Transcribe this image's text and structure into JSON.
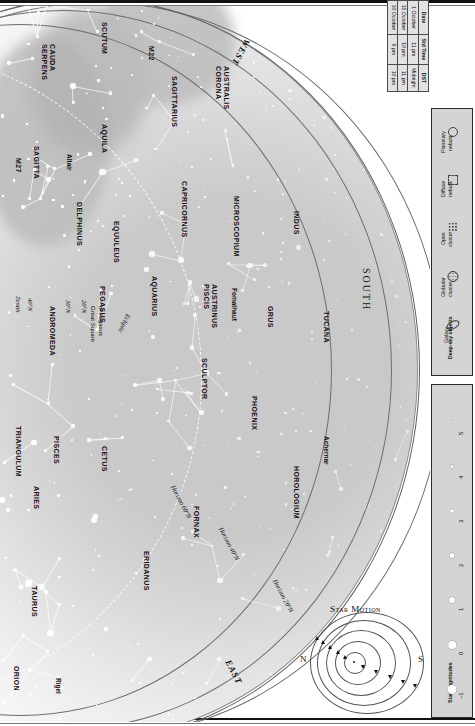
{
  "chart_data": {
    "type": "scatter",
    "subtitle": "All-sky map looking south, printed sideways",
    "axis_note": "Sky dome projection; concentric arcs are horizon lines for 20°N, 40°N and 60°N latitude",
    "grid": false,
    "legend_position": "right-rail",
    "compass": [
      "WEST",
      "SOUTH",
      "EAST"
    ],
    "zenith_label": "Zenith",
    "horizons": [
      "Horizon 20°N",
      "Horizon 40°N",
      "Horizon 60°N"
    ],
    "latitude_marks": [
      "40°N",
      "30°N",
      "20°N"
    ],
    "ecliptic_label": "Ecliptic",
    "asterisms": [
      "Great Square of Pegasus"
    ],
    "constellations": [
      "SERPENS CAUDA",
      "SCUTUM",
      "AQUILA",
      "SAGITTA",
      "DELPHINUS",
      "EQUULEUS",
      "SAGITTARIUS",
      "CORONA AUSTRALIS",
      "CAPRICORNUS",
      "MICROSCOPIUM",
      "INDUS",
      "PEGASUS",
      "ANDROMEDA",
      "AQUARIUS",
      "PISCIS AUSTRINUS",
      "GRUS",
      "TUCANA",
      "PISCES",
      "CETUS",
      "SCULPTOR",
      "PHOENIX",
      "TRIANGULUM",
      "ARIES",
      "FORNAX",
      "ERIDANUS",
      "HOROLOGIUM",
      "TAURUS",
      "ORION"
    ],
    "named_stars": [
      {
        "name": "Altair",
        "magnitude": 0.8
      },
      {
        "name": "Fomalhaut",
        "magnitude": 1.2
      },
      {
        "name": "Achernar",
        "magnitude": 0.5
      },
      {
        "name": "Rigel",
        "magnitude": 0.1
      }
    ],
    "deep_sky_objects": [
      {
        "name": "M27",
        "type": "Planetary nebula"
      },
      {
        "name": "M22",
        "type": "Globular cluster"
      }
    ],
    "magnitude_scale": [
      "–1",
      "0",
      "1",
      "2",
      "3",
      "4",
      "5"
    ],
    "time_table": {
      "headers": [
        "Date",
        "Std Time",
        "DST"
      ],
      "rows": [
        [
          "1 October",
          "11 pm",
          "Midnight"
        ],
        [
          "15 October",
          "10 pm",
          "11 pm"
        ],
        [
          "30 October",
          "9 pm",
          "10 pm"
        ]
      ]
    }
  },
  "time_table": {
    "headers": {
      "date": "Date",
      "std": "Std Time",
      "dst": "DST"
    },
    "rows": [
      {
        "date": "1 October",
        "std": "11 pm",
        "dst": "Midnight"
      },
      {
        "date": "15 October",
        "std": "10 pm",
        "dst": "11 pm"
      },
      {
        "date": "30 October",
        "std": "9 pm",
        "dst": "10 pm"
      }
    ]
  },
  "legend": {
    "deep_sky_title": "Deep-sky objects",
    "items": [
      {
        "label": "Galaxy",
        "icon": "galaxy-icon"
      },
      {
        "label": "Globular\ncluster",
        "icon": "globular-cluster-icon",
        "l1": "Globular",
        "l2": "cluster"
      },
      {
        "label": "Open\ncluster",
        "icon": "open-cluster-icon",
        "l1": "Open",
        "l2": "cluster"
      },
      {
        "label": "Diffuse\nnebula",
        "icon": "diffuse-nebula-icon",
        "l1": "Diffuse",
        "l2": "nebula"
      },
      {
        "label": "Planetary\nnebula",
        "icon": "planetary-nebula-icon",
        "l1": "Planetary",
        "l2": "nebula"
      }
    ],
    "magnitudes_title": "Star magnitudes",
    "magnitudes": [
      "–1",
      "0",
      "1",
      "2",
      "3",
      "4",
      "5"
    ]
  },
  "star_motion": {
    "title": "Star Motion",
    "north": "N",
    "south": "S"
  },
  "map": {
    "directions": {
      "west": "WEST",
      "south": "SOUTH",
      "east": "EAST"
    },
    "zenith": "Zenith",
    "latitudes": [
      "40°N",
      "30°N",
      "20°N"
    ],
    "horizons": [
      "Horizon 20°N",
      "Horizon 40°N",
      "Horizon 60°N"
    ],
    "ecliptic": "Ecliptic",
    "great_square": {
      "l1": "Great Square",
      "l2": "of Pegasus"
    },
    "constellations": [
      {
        "name": "SERPENS",
        "name2": "CAUDA",
        "x": 48,
        "y": 38,
        "rot": 90
      },
      {
        "name": "SCUTUM",
        "x": 108,
        "y": 16,
        "rot": 90
      },
      {
        "name": "M22",
        "x": 155,
        "y": 40,
        "rot": 90
      },
      {
        "name": "AQUILA",
        "x": 108,
        "y": 118,
        "rot": 90
      },
      {
        "name": "M27",
        "x": 22,
        "y": 152,
        "rot": 90
      },
      {
        "name": "SAGITTA",
        "x": 40,
        "y": 140,
        "rot": 90
      },
      {
        "name": "Altair",
        "x": 73,
        "y": 148,
        "rot": 90
      },
      {
        "name": "DELPHINUS",
        "x": 83,
        "y": 196,
        "rot": 90
      },
      {
        "name": "SAGITTARIUS",
        "x": 178,
        "y": 70,
        "rot": 90
      },
      {
        "name": "CORONA",
        "name2": "AUSTRALIS",
        "x": 222,
        "y": 60,
        "rot": 90
      },
      {
        "name": "EQUULEUS",
        "x": 120,
        "y": 215,
        "rot": 90
      },
      {
        "name": "CAPRICORNUS",
        "x": 188,
        "y": 175,
        "rot": 90
      },
      {
        "name": "MICROSCOPIUM",
        "x": 240,
        "y": 190,
        "rot": 90
      },
      {
        "name": "INDUS",
        "x": 300,
        "y": 205,
        "rot": 90
      },
      {
        "name": "PEGASUS",
        "x": 106,
        "y": 280,
        "rot": 90
      },
      {
        "name": "ANDROMEDA",
        "x": 56,
        "y": 300,
        "rot": 90
      },
      {
        "name": "AQUARIUS",
        "x": 158,
        "y": 270,
        "rot": 90
      },
      {
        "name": "PISCIS",
        "name2": "AUSTRINUS",
        "x": 210,
        "y": 278,
        "rot": 90
      },
      {
        "name": "Fomalhaut",
        "x": 238,
        "y": 282,
        "rot": 90
      },
      {
        "name": "GRUS",
        "x": 274,
        "y": 300,
        "rot": 90
      },
      {
        "name": "TUCANA",
        "x": 330,
        "y": 305,
        "rot": 90
      },
      {
        "name": "PISCES",
        "x": 60,
        "y": 430,
        "rot": 90
      },
      {
        "name": "TRIANGULUM",
        "x": 22,
        "y": 420,
        "rot": 90
      },
      {
        "name": "ARIES",
        "x": 40,
        "y": 480,
        "rot": 90
      },
      {
        "name": "CETUS",
        "x": 108,
        "y": 440,
        "rot": 90
      },
      {
        "name": "SCULPTOR",
        "x": 208,
        "y": 352,
        "rot": 90
      },
      {
        "name": "PHOENIX",
        "x": 258,
        "y": 390,
        "rot": 90
      },
      {
        "name": "HOROLOGIUM",
        "x": 300,
        "y": 460,
        "rot": 90
      },
      {
        "name": "Achernar",
        "x": 330,
        "y": 430,
        "rot": 90
      },
      {
        "name": "FORNAX",
        "x": 200,
        "y": 500,
        "rot": 90
      },
      {
        "name": "ERIDANUS",
        "x": 150,
        "y": 545,
        "rot": 90
      },
      {
        "name": "TAURUS",
        "x": 38,
        "y": 580,
        "rot": 90
      },
      {
        "name": "ORION",
        "x": 20,
        "y": 660,
        "rot": 90
      },
      {
        "name": "Rigel",
        "x": 62,
        "y": 672,
        "rot": 90
      }
    ]
  }
}
